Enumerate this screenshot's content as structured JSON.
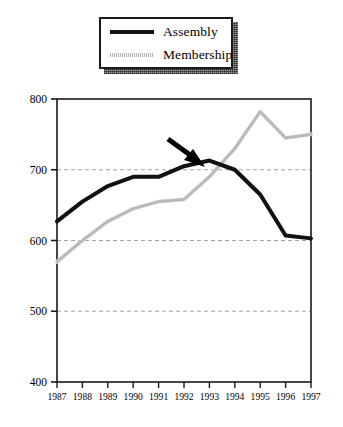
{
  "figure": {
    "background": "#ffffff",
    "width": 343,
    "height": 427
  },
  "legend": {
    "position": "top-center",
    "has_shadow": true,
    "entries": [
      {
        "label": "Assembly",
        "color": "#111111",
        "style": "solid-thick"
      },
      {
        "label": "Membership",
        "color": "#c8c8c8",
        "style": "dotted-light"
      }
    ]
  },
  "annotation": {
    "type": "arrow",
    "direction": "down-right",
    "target_year": "1993",
    "target_value": 713,
    "color": "#000000",
    "description": "black arrow pointing to the crossover of the two lines near 1993"
  },
  "chart_data": {
    "type": "line",
    "title": "",
    "subtitle": "",
    "xlabel": "",
    "ylabel": "",
    "x": [
      "1987",
      "1988",
      "1989",
      "1990",
      "1991",
      "1992",
      "1993",
      "1994",
      "1995",
      "1996",
      "1997"
    ],
    "categories": [
      "1987",
      "1988",
      "1989",
      "1990",
      "1991",
      "1992",
      "1993",
      "1994",
      "1995",
      "1996",
      "1997"
    ],
    "series": [
      {
        "name": "Assembly",
        "color": "#111111",
        "linewidth": 4,
        "values": [
          627,
          655,
          677,
          690,
          690,
          705,
          713,
          700,
          665,
          607,
          603
        ]
      },
      {
        "name": "Membership",
        "color": "#c8c8c8",
        "linewidth": 3,
        "values": [
          570,
          600,
          627,
          645,
          655,
          658,
          690,
          730,
          782,
          745,
          750
        ]
      }
    ],
    "ylim": [
      400,
      800
    ],
    "yticks": [
      400,
      500,
      600,
      700,
      800
    ],
    "ytick_labels": [
      "400",
      "500",
      "600",
      "700",
      "800"
    ],
    "xlim": [
      "1987",
      "1997"
    ],
    "grid": true,
    "grid_axis": "y",
    "grid_style": "dashed",
    "grid_color": "#999999",
    "legend_position": "top-center",
    "frame": true
  }
}
